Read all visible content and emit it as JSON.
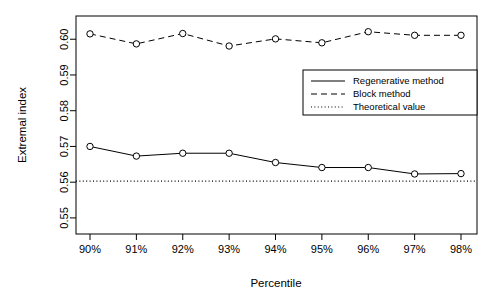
{
  "chart_data": {
    "type": "line",
    "title": "",
    "xlabel": "Percentile",
    "ylabel": "Extremal index",
    "categories": [
      "90%",
      "91%",
      "92%",
      "93%",
      "94%",
      "95%",
      "96%",
      "97%",
      "98%"
    ],
    "x_tick_labels": [
      "90%",
      "91%",
      "92%",
      "93%",
      "94%",
      "95%",
      "96%",
      "97%",
      "98%"
    ],
    "y_tick_labels": [
      "0.55",
      "0.56",
      "0.57",
      "0.58",
      "0.59",
      "0.60"
    ],
    "y_tick_values": [
      0.55,
      0.56,
      0.57,
      0.58,
      0.59,
      0.6
    ],
    "ylim": [
      0.5455,
      0.6065
    ],
    "xlim": [
      0,
      10
    ],
    "grid": false,
    "legend_position": "upper-right-inside",
    "series": [
      {
        "name": "Regenerative method",
        "style": "solid",
        "marker": "open-circle",
        "color": "#000000",
        "values": [
          0.57,
          0.5673,
          0.5681,
          0.5681,
          0.5655,
          0.5641,
          0.5641,
          0.5623,
          0.5624
        ]
      },
      {
        "name": "Block method",
        "style": "dashed",
        "marker": "open-circle",
        "color": "#000000",
        "values": [
          0.6015,
          0.5987,
          0.6016,
          0.5981,
          0.6001,
          0.599,
          0.6021,
          0.6011,
          0.6011
        ]
      },
      {
        "name": "Theoretical value",
        "style": "dotted",
        "marker": "none",
        "color": "#000000",
        "constant": 0.5603,
        "values": [
          0.5603,
          0.5603,
          0.5603,
          0.5603,
          0.5603,
          0.5603,
          0.5603,
          0.5603,
          0.5603
        ]
      }
    ]
  },
  "legend": {
    "entries": [
      {
        "label": "Regenerative method",
        "style": "solid"
      },
      {
        "label": "Block method",
        "style": "dashed"
      },
      {
        "label": "Theoretical value",
        "style": "dotted"
      }
    ]
  },
  "axes": {
    "x_title": "Percentile",
    "y_title": "Extremal index"
  },
  "colors": {
    "background": "#ffffff",
    "foreground": "#000000",
    "axis": "#000000"
  }
}
